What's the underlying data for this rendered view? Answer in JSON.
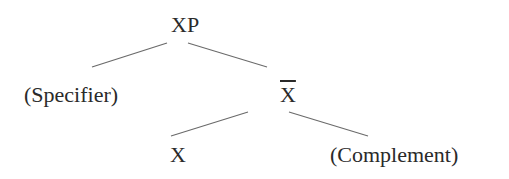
{
  "diagram": {
    "type": "x-bar syntax tree",
    "nodes": [
      {
        "id": "xp",
        "label": "XP"
      },
      {
        "id": "specifier",
        "label": "(Specifier)"
      },
      {
        "id": "xbar",
        "label": "X",
        "overline": true,
        "reading": "X-bar"
      },
      {
        "id": "x",
        "label": "X"
      },
      {
        "id": "complement",
        "label": "(Complement)"
      }
    ],
    "edges": [
      {
        "from": "xp",
        "to": "specifier"
      },
      {
        "from": "xp",
        "to": "xbar"
      },
      {
        "from": "xbar",
        "to": "x"
      },
      {
        "from": "xbar",
        "to": "complement"
      }
    ],
    "colors": {
      "background": "#ffffff",
      "text": "#2a2a2a",
      "line": "#6a6a6a"
    }
  }
}
